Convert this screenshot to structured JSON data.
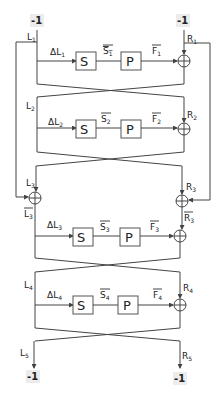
{
  "inputs": {
    "left": "-1",
    "right": "-1"
  },
  "outputs": {
    "left": "-1",
    "right": "-1"
  },
  "labels": {
    "L1": "L",
    "L1_sub": "1",
    "R1": "R",
    "R1_sub": "1",
    "L2": "L",
    "L2_sub": "2",
    "R2": "R",
    "R2_sub": "2",
    "L3": "L",
    "L3_sub": "3",
    "R3": "R",
    "R3_sub": "3",
    "L3bar": "L",
    "L3bar_sub": "3",
    "R3bar": "R",
    "R3bar_sub": "3",
    "L4": "L",
    "L4_sub": "4",
    "R4": "R",
    "R4_sub": "4",
    "L5": "L",
    "L5_sub": "5",
    "R5": "R",
    "R5_sub": "5"
  },
  "rounds": [
    {
      "dL": "ΔL",
      "dL_sub": "1",
      "S": "S",
      "Sbar": "S",
      "Sbar_sub": "1",
      "P": "P",
      "Fbar": "F",
      "Fbar_sub": "1"
    },
    {
      "dL": "ΔL",
      "dL_sub": "2",
      "S": "S",
      "Sbar": "S",
      "Sbar_sub": "2",
      "P": "P",
      "Fbar": "F",
      "Fbar_sub": "2"
    },
    {
      "dL": "ΔL",
      "dL_sub": "3",
      "S": "S",
      "Sbar": "S",
      "Sbar_sub": "3",
      "P": "P",
      "Fbar": "F",
      "Fbar_sub": "3"
    },
    {
      "dL": "ΔL",
      "dL_sub": "4",
      "S": "S",
      "Sbar": "S",
      "Sbar_sub": "4",
      "P": "P",
      "Fbar": "F",
      "Fbar_sub": "4"
    }
  ],
  "colors": {
    "line": "#444444",
    "background": "#ffffff"
  }
}
